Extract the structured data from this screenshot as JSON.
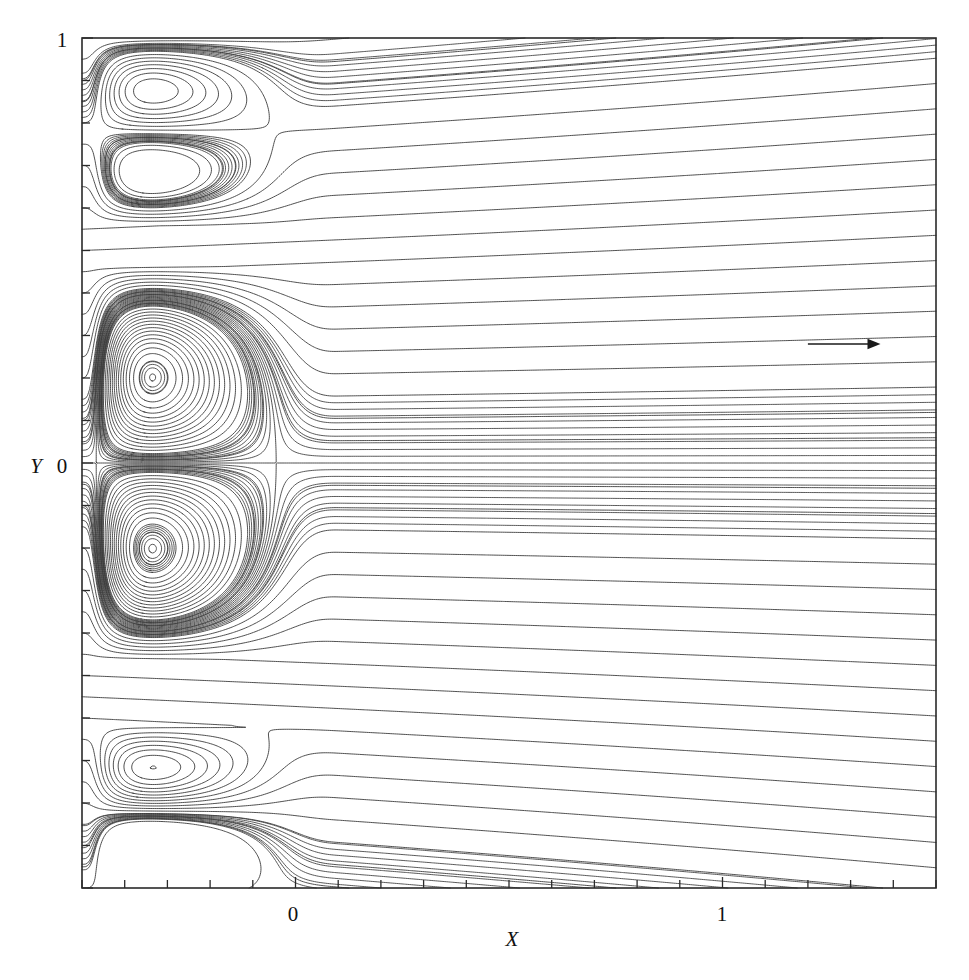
{
  "figure": {
    "title": "",
    "background": "#ffffff",
    "line_color": "#3b3b3b",
    "frame_color": "#2a2a2a"
  },
  "axes": {
    "x_label": "X",
    "y_label": "Y",
    "x_ticklabels": [
      "0",
      "1"
    ],
    "x_ticklabel_values": [
      0,
      1
    ],
    "y_ticklabels": [
      "0",
      "1"
    ],
    "y_ticklabel_values": [
      0,
      1
    ],
    "x_range": [
      -0.5,
      1.5
    ],
    "y_range": [
      -1.0,
      1.0
    ],
    "x_minor_tick_step": 0.1,
    "y_minor_tick_step": 0.1,
    "grid": "off",
    "tick_direction": "in"
  },
  "annotations": {
    "flow_arrow": {
      "label": "",
      "direction": "right",
      "x_start": 1.2,
      "x_end": 1.37,
      "y": 0.28
    }
  },
  "chart_data": {
    "type": "line",
    "title": "",
    "xlabel": "X",
    "ylabel": "Y",
    "xlim": [
      -0.5,
      1.5
    ],
    "ylim": [
      -1.0,
      1.0
    ],
    "grid": false,
    "legend": "none",
    "series": [
      {
        "name": "streamlines",
        "count": 58,
        "style": "solid",
        "color": "#3b3b3b",
        "width": 1
      }
    ],
    "features": [
      {
        "name": "vortex-upper",
        "center_x": -0.47,
        "center_y": 0.77,
        "rotation": "clockwise",
        "reattachment_x": 0.03
      },
      {
        "name": "vortex-core-upper",
        "center_x": -0.475,
        "center_y": 0.22,
        "rotation": "clockwise",
        "reattachment_x": 0.02
      },
      {
        "name": "vortex-core-lower",
        "center_x": -0.475,
        "center_y": -0.22,
        "rotation": "counter-clockwise",
        "reattachment_x": 0.02
      },
      {
        "name": "vortex-lower",
        "center_x": -0.47,
        "center_y": -0.83,
        "rotation": "counter-clockwise",
        "reattachment_x": 0.02
      },
      {
        "name": "saddle-point",
        "center_x": 0.03,
        "center_y": 0.0
      }
    ],
    "centerline_y": 0.0
  }
}
